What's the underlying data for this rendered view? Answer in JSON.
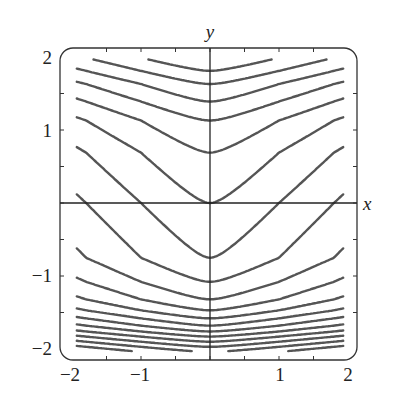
{
  "chart_data": {
    "type": "line",
    "title": "",
    "xlabel": "x",
    "ylabel": "y",
    "xlim": [
      -2,
      2
    ],
    "ylim": [
      -2,
      2
    ],
    "grid": false,
    "legend": null,
    "x_tick_labels": [
      "−2",
      "−1",
      "1",
      "2"
    ],
    "x_tick_values": [
      -2,
      -1,
      1,
      2
    ],
    "y_tick_labels": [
      "2",
      "1",
      "−1",
      "−2"
    ],
    "y_tick_values": [
      2,
      1,
      -1,
      -2
    ],
    "minor_ticks": [
      -1.5,
      -1,
      -0.5,
      0,
      0.5,
      1,
      1.5
    ],
    "curve_vertex_y_values": [
      2.6,
      2.35,
      2.15,
      1.99,
      1.81,
      1.63,
      1.39,
      1.13,
      0.69,
      0.0,
      -0.75,
      -1.08,
      -1.32,
      -1.47,
      -1.58,
      -1.68,
      -1.76,
      -1.83,
      -1.9,
      -1.97,
      -2.04,
      -2.1,
      -2.16
    ],
    "curve_color": "#555555",
    "axis_color": "#222222"
  }
}
